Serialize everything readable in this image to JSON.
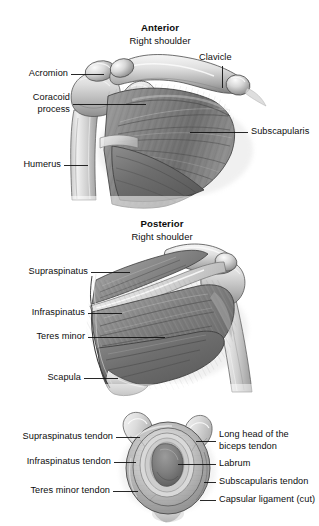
{
  "figure": {
    "type": "anatomical-illustration",
    "style": "grayscale medical line drawing",
    "colors": {
      "background": "#ffffff",
      "bone_light": "#e2e2e2",
      "bone_mid": "#bdbdbd",
      "bone_shadow": "#8f8f8f",
      "muscle_light": "#a9a9a9",
      "muscle_mid": "#8a8a8a",
      "muscle_dark": "#636363",
      "outline": "#2b2b2b",
      "leader_line": "#111111",
      "text": "#0d0d0d"
    }
  },
  "panels": [
    {
      "id": "anterior",
      "heading": "Anterior",
      "subheading": "Right shoulder",
      "labels_left": [
        {
          "text": "Acromion",
          "lines": [
            "Acromion"
          ]
        },
        {
          "text": "Coracoid process",
          "lines": [
            "Coracoid",
            "process"
          ]
        },
        {
          "text": "Humerus",
          "lines": [
            "Humerus"
          ]
        }
      ],
      "labels_right": [
        {
          "text": "Clavicle",
          "lines": [
            "Clavicle"
          ]
        },
        {
          "text": "Subscapularis",
          "lines": [
            "Subscapularis"
          ]
        }
      ]
    },
    {
      "id": "posterior",
      "heading": "Posterior",
      "subheading": "Right shoulder",
      "labels_left": [
        {
          "text": "Supraspinatus",
          "lines": [
            "Supraspinatus"
          ]
        },
        {
          "text": "Infraspinatus",
          "lines": [
            "Infraspinatus"
          ]
        },
        {
          "text": "Teres minor",
          "lines": [
            "Teres minor"
          ]
        },
        {
          "text": "Scapula",
          "lines": [
            "Scapula"
          ]
        }
      ],
      "labels_right": []
    },
    {
      "id": "glenoid",
      "heading": "",
      "subheading": "",
      "labels_left": [
        {
          "text": "Supraspinatus tendon",
          "lines": [
            "Supraspinatus tendon"
          ]
        },
        {
          "text": "Infraspinatus tendon",
          "lines": [
            "Infraspinatus tendon"
          ]
        },
        {
          "text": "Teres minor tendon",
          "lines": [
            "Teres minor tendon"
          ]
        }
      ],
      "labels_right": [
        {
          "text": "Long head of the biceps tendon",
          "lines": [
            "Long head of the",
            "biceps tendon"
          ]
        },
        {
          "text": "Labrum",
          "lines": [
            "Labrum"
          ]
        },
        {
          "text": "Subscapularis tendon",
          "lines": [
            "Subscapularis tendon"
          ]
        },
        {
          "text": "Capsular ligament (cut)",
          "lines": [
            "Capsular ligament (cut)"
          ]
        }
      ]
    }
  ],
  "anterior": {
    "heading": "Anterior",
    "subheading": "Right shoulder",
    "acromion": "Acromion",
    "coracoid_line1": "Coracoid",
    "coracoid_line2": "process",
    "humerus": "Humerus",
    "clavicle": "Clavicle",
    "subscapularis": "Subscapularis"
  },
  "posterior": {
    "heading": "Posterior",
    "subheading": "Right shoulder",
    "supraspinatus": "Supraspinatus",
    "infraspinatus": "Infraspinatus",
    "teres_minor": "Teres minor",
    "scapula": "Scapula"
  },
  "glenoid": {
    "supraspinatus_tendon": "Supraspinatus tendon",
    "infraspinatus_tendon": "Infraspinatus tendon",
    "teres_minor_tendon": "Teres minor tendon",
    "biceps_line1": "Long head of the",
    "biceps_line2": "biceps tendon",
    "labrum": "Labrum",
    "subscapularis_tendon": "Subscapularis tendon",
    "capsular_ligament": "Capsular ligament (cut)"
  }
}
